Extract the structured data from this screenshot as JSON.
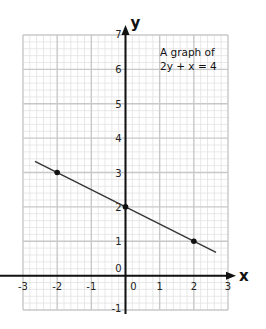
{
  "chart_data": {
    "type": "line",
    "title": "A graph of",
    "subtitle": "2y + x = 4",
    "xlabel": "x",
    "ylabel": "y",
    "xlim": [
      -3,
      3
    ],
    "ylim": [
      -1,
      7
    ],
    "grid": true,
    "minor_grid_per_unit": 5,
    "x_ticks": [
      -3,
      -2,
      -1,
      0,
      1,
      2,
      3
    ],
    "x_tick_labels": [
      "-3",
      "-2",
      "-1",
      "0",
      "1",
      "2",
      "3"
    ],
    "y_ticks": [
      -1,
      0,
      1,
      2,
      3,
      4,
      5,
      6,
      7
    ],
    "y_tick_labels": [
      "-1",
      "0",
      "1",
      "2",
      "3",
      "4",
      "5",
      "6",
      "7"
    ],
    "series": [
      {
        "name": "2y + x = 4",
        "line": {
          "x": [
            -2.65,
            2.65
          ],
          "y": [
            3.325,
            0.675
          ]
        },
        "points": [
          {
            "x": -2,
            "y": 3
          },
          {
            "x": 0,
            "y": 2
          },
          {
            "x": 2,
            "y": 1
          }
        ],
        "color": "#333333"
      }
    ]
  },
  "colors": {
    "minor_grid": "#e2e2e2",
    "major_grid": "#c8c8c8",
    "axis": "#111111",
    "line": "#333333"
  }
}
